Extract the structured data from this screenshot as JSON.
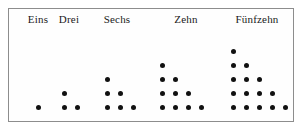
{
  "figure": {
    "frame": {
      "border_color": "#8d8d8d",
      "background_color": "#fefefe"
    },
    "dot_color": "#111111",
    "groups": [
      {
        "label": "Eins",
        "count": 1,
        "rows": [
          1
        ],
        "label_center_x": 38,
        "base_left_x": 36,
        "dot_spacing_x": 13,
        "row_spacing_y": 14,
        "baseline_y": 105
      },
      {
        "label": "Drei",
        "count": 3,
        "rows": [
          1,
          2
        ],
        "label_center_x": 69,
        "base_left_x": 62,
        "dot_spacing_x": 13,
        "row_spacing_y": 14,
        "baseline_y": 105
      },
      {
        "label": "Sechs",
        "count": 6,
        "rows": [
          1,
          2,
          3
        ],
        "label_center_x": 117,
        "base_left_x": 105,
        "dot_spacing_x": 13,
        "row_spacing_y": 14,
        "baseline_y": 105
      },
      {
        "label": "Zehn",
        "count": 10,
        "rows": [
          1,
          2,
          3,
          4
        ],
        "label_center_x": 186,
        "base_left_x": 160,
        "dot_spacing_x": 13,
        "row_spacing_y": 14,
        "baseline_y": 105
      },
      {
        "label": "Fünfzehn",
        "count": 15,
        "rows": [
          1,
          2,
          3,
          4,
          5
        ],
        "label_center_x": 257,
        "base_left_x": 231,
        "dot_spacing_x": 13,
        "row_spacing_y": 14,
        "baseline_y": 105
      }
    ]
  },
  "chart_data": {
    "type": "scatter",
    "categories": [
      "Eins",
      "Drei",
      "Sechs",
      "Zehn",
      "Fünfzehn"
    ],
    "values": [
      1,
      3,
      6,
      10,
      15
    ],
    "xlabel": "",
    "ylabel": "",
    "grid": false,
    "legend": "none",
    "series": [
      {
        "name": "Dreieckszahlen",
        "values": [
          1,
          3,
          6,
          10,
          15
        ],
        "row_counts": [
          [
            1
          ],
          [
            1,
            2
          ],
          [
            1,
            2,
            3
          ],
          [
            1,
            2,
            3,
            4
          ],
          [
            1,
            2,
            3,
            4,
            5
          ]
        ]
      }
    ]
  }
}
